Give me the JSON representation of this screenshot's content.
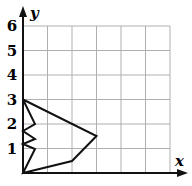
{
  "diagram": {
    "type": "coordinate-grid-polygon",
    "x_axis_label": "x",
    "y_axis_label": "y",
    "y_ticks": [
      "1",
      "2",
      "3",
      "4",
      "5",
      "6"
    ],
    "grid": {
      "x_range": [
        0,
        6
      ],
      "y_range": [
        0,
        6
      ]
    },
    "polygon_vertices": [
      [
        0,
        3
      ],
      [
        3,
        1.5
      ],
      [
        2,
        0.5
      ],
      [
        0,
        0
      ],
      [
        0.5,
        1
      ],
      [
        0,
        1.2
      ],
      [
        0.5,
        1.4
      ],
      [
        0,
        1.7
      ],
      [
        0.5,
        2
      ],
      [
        0,
        3
      ]
    ],
    "colors": {
      "grid": "#b0b0b0",
      "axis": "#111111",
      "shape": "#111111"
    }
  }
}
